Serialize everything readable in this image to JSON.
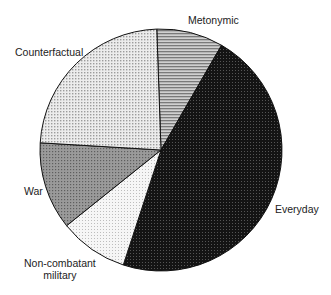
{
  "chart_data": {
    "type": "pie",
    "title": "",
    "start_angle_deg": -2,
    "direction": "clockwise",
    "slices": [
      {
        "label": "Metonymic",
        "percent": 8.9,
        "fill": "#b0b0b0",
        "pattern": "horizontal-lines"
      },
      {
        "label": "Everyday",
        "percent": 46.7,
        "fill": "#1c1c1c",
        "pattern": "dense-dots"
      },
      {
        "label": "Non-combatant military",
        "percent": 9.2,
        "fill": "#f2f2f2",
        "pattern": "fine-dots"
      },
      {
        "label": "War",
        "percent": 11.7,
        "fill": "#8a8a8a",
        "pattern": "medium-dots"
      },
      {
        "label": "Counterfactual",
        "percent": 23.5,
        "fill": "#d8d8d8",
        "pattern": "checker-dots"
      }
    ],
    "legend": "none (direct labels)"
  },
  "labels": {
    "metonymic": "Metonymic",
    "everyday": "Everyday",
    "noncombatant_line1": "Non-combatant",
    "noncombatant_line2": "military",
    "war": "War",
    "counterfactual": "Counterfactual"
  }
}
